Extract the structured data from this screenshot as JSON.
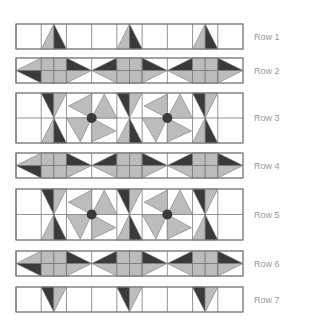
{
  "diagram": {
    "colors": {
      "background": "#ffffff",
      "outline": "#7a7a7a",
      "light": "#bcbcbc",
      "dark": "#3a3a3a",
      "center_dot": "#3a3a3a",
      "label": "#9a9a9a"
    },
    "grid": {
      "left": 16,
      "right": 243,
      "columns": 9
    },
    "rows": [
      {
        "label": "Row 1",
        "type": "triangle-up",
        "top": 24,
        "bottom": 49
      },
      {
        "label": "Row 2",
        "type": "arrows",
        "top": 58,
        "bottom": 83
      },
      {
        "label": "Row 3",
        "type": "pinwheel",
        "top": 93,
        "bottom": 143
      },
      {
        "label": "Row 4",
        "type": "arrows",
        "top": 153,
        "bottom": 178
      },
      {
        "label": "Row 5",
        "type": "pinwheel",
        "top": 189,
        "bottom": 240
      },
      {
        "label": "Row 6",
        "type": "arrows",
        "top": 251,
        "bottom": 276
      },
      {
        "label": "Row 7",
        "type": "triangle-down",
        "top": 287,
        "bottom": 312
      }
    ]
  }
}
